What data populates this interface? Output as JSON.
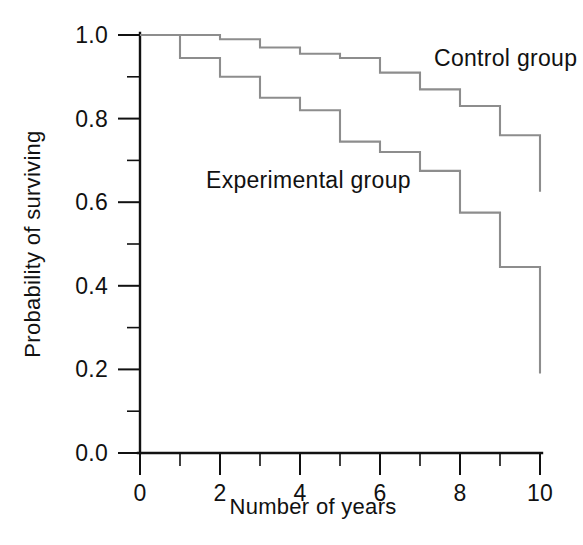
{
  "chart_data": {
    "type": "line",
    "title": "",
    "subtitle": "",
    "xlabel": "Number of years",
    "ylabel": "Probability of surviving",
    "xlim": [
      0,
      10
    ],
    "ylim": [
      0.0,
      1.0
    ],
    "grid": false,
    "legend_position": "inline-annotations",
    "step_style": "post",
    "x_ticks_major": [
      0,
      2,
      4,
      6,
      8,
      10
    ],
    "x_tick_labels": [
      "0",
      "2",
      "4",
      "6",
      "8",
      "10"
    ],
    "x_ticks_minor": [
      1,
      3,
      5,
      7,
      9
    ],
    "y_ticks_major": [
      0.0,
      0.2,
      0.4,
      0.6,
      0.8,
      1.0
    ],
    "y_tick_labels": [
      "0.0",
      "0.2",
      "0.4",
      "0.6",
      "0.8",
      "1.0"
    ],
    "y_ticks_minor": [
      0.1,
      0.3,
      0.5,
      0.7,
      0.9
    ],
    "x": [
      0,
      1,
      2,
      3,
      4,
      5,
      6,
      7,
      8,
      9,
      10
    ],
    "series": [
      {
        "name": "Control group",
        "color": "#8d8d8d",
        "values": [
          1.0,
          1.0,
          0.99,
          0.97,
          0.955,
          0.945,
          0.91,
          0.87,
          0.83,
          0.76,
          0.685
        ],
        "final_drop_value": 0.625,
        "annotation": {
          "text": "Control group",
          "x": 7.35,
          "y": 0.925
        }
      },
      {
        "name": "Experimental group",
        "color": "#8d8d8d",
        "values": [
          1.0,
          0.945,
          0.9,
          0.85,
          0.82,
          0.745,
          0.72,
          0.675,
          0.575,
          0.445,
          0.315
        ],
        "final_drop_value": 0.19,
        "annotation": {
          "text": "Experimental group",
          "x": 1.65,
          "y": 0.635
        }
      }
    ],
    "annotations": [
      {
        "text": "Control group",
        "x": 7.35,
        "y": 0.925
      },
      {
        "text": "Experimental group",
        "x": 1.65,
        "y": 0.635
      }
    ]
  },
  "colors": {
    "background": "#ffffff",
    "axis": "#111111",
    "text": "#111111",
    "series_line": "#8d8d8d"
  }
}
